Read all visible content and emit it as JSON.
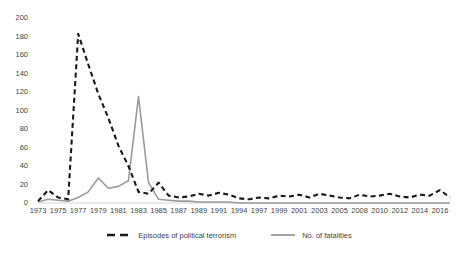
{
  "chart_data": {
    "type": "line",
    "title": "",
    "subtitle": "",
    "xlabel": "",
    "ylabel": "",
    "grid": false,
    "legend_position": "bottom",
    "ylim": [
      0,
      200
    ],
    "y_ticks": [
      0,
      20,
      40,
      60,
      80,
      100,
      120,
      140,
      160,
      180,
      200
    ],
    "categories": [
      "1973",
      "1974",
      "1975",
      "1976",
      "1977",
      "1978",
      "1979",
      "1980",
      "1981",
      "1982",
      "1983",
      "1984",
      "1985",
      "1986",
      "1987",
      "1988",
      "1989",
      "1990",
      "1991",
      "1992",
      "1994",
      "1995",
      "1997",
      "1998",
      "1999",
      "2000",
      "2001",
      "2002",
      "2003",
      "2004",
      "2005",
      "2006",
      "2008",
      "2009",
      "2010",
      "2011",
      "2012",
      "2013",
      "2014",
      "2015",
      "2016",
      "2017"
    ],
    "x_tick_labels": [
      "1973",
      "1975",
      "1977",
      "1979",
      "1981",
      "1983",
      "1985",
      "1987",
      "1989",
      "1991",
      "1994",
      "1997",
      "1999",
      "2001",
      "2003",
      "2005",
      "2008",
      "2010",
      "2012",
      "2014",
      "2016"
    ],
    "series": [
      {
        "name": "Episodes of political terrorism",
        "color": "#1a1a1a",
        "style": "dashed",
        "values": [
          2,
          14,
          6,
          4,
          183,
          150,
          118,
          92,
          62,
          40,
          12,
          10,
          22,
          8,
          6,
          7,
          10,
          8,
          11,
          9,
          5,
          4,
          6,
          5,
          8,
          7,
          9,
          6,
          10,
          8,
          6,
          5,
          9,
          7,
          8,
          10,
          7,
          6,
          9,
          8,
          14,
          6
        ]
      },
      {
        "name": "No. of fatalities",
        "color": "#9a9a9a",
        "style": "solid",
        "values": [
          1,
          4,
          3,
          2,
          6,
          12,
          27,
          16,
          18,
          24,
          115,
          22,
          4,
          3,
          2,
          2,
          1,
          1,
          1,
          1,
          0,
          0,
          0,
          0,
          0,
          0,
          0,
          0,
          0,
          0,
          0,
          0,
          0,
          0,
          0,
          0,
          0,
          0,
          0,
          0,
          0,
          0
        ]
      }
    ]
  },
  "legend": {
    "entries": [
      {
        "label": "Episodes of political terrorism",
        "marker": "dashed-line-swatch"
      },
      {
        "label": "No. of fatalities",
        "marker": "solid-line-swatch"
      }
    ]
  },
  "axis": {
    "y_title": "",
    "x_title": ""
  }
}
